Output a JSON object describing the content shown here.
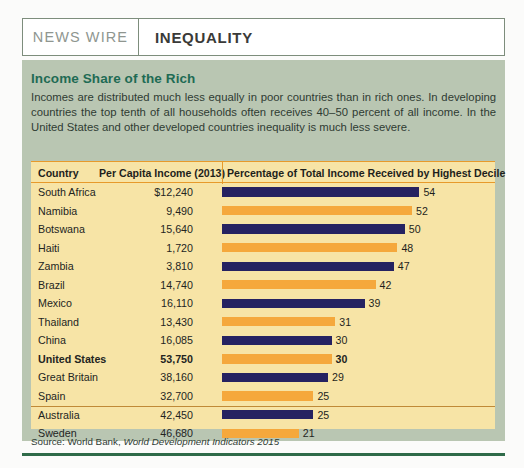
{
  "header": {
    "kicker": "NEWS WIRE",
    "topic": "INEQUALITY"
  },
  "figure": {
    "title": "Income Share of the Rich",
    "intro": "Incomes are distributed much less equally in poor countries than in rich ones. In developing countries the top tenth of all households often receives 40–50 percent of all income. In the United States and other developed countries inequality is much less severe.",
    "source_prefix": "Source: World Bank, ",
    "source_italic": "World Development Indicators 2015"
  },
  "table": {
    "columns": {
      "country": "Country",
      "income": "Per Capita Income (2013)",
      "percentage": "Percentage of Total Income Received by Highest Decile"
    }
  },
  "colors": {
    "navy": "#262261",
    "orange": "#f5a83c",
    "panel_green": "#b9c6b2",
    "panel_yellow": "#f7e4a6",
    "title_green": "#1f6b54",
    "rule_green": "#2f6b49"
  },
  "chart_data": {
    "type": "bar",
    "title": "Income Share of the Rich",
    "subtitle": "Percentage of Total Income Received by Highest Decile",
    "xlabel": "Percentage of Total Income Received by Highest Decile",
    "ylabel": "Country",
    "xlim": [
      0,
      54
    ],
    "grid": false,
    "legend_position": "none",
    "orientation": "horizontal",
    "categories": [
      "South Africa",
      "Namibia",
      "Botswana",
      "Haiti",
      "Zambia",
      "Brazil",
      "Mexico",
      "Thailand",
      "China",
      "United States",
      "Great Britain",
      "Spain",
      "Australia",
      "Sweden"
    ],
    "values": [
      54,
      52,
      50,
      48,
      47,
      42,
      39,
      31,
      30,
      30,
      29,
      25,
      25,
      21
    ],
    "rows": [
      {
        "country": "South Africa",
        "income": "$12,240",
        "value": 54,
        "label": "54",
        "color": "navy",
        "highlight": false
      },
      {
        "country": "Namibia",
        "income": "9,490",
        "value": 52,
        "label": "52",
        "color": "orange",
        "highlight": false
      },
      {
        "country": "Botswana",
        "income": "15,640",
        "value": 50,
        "label": "50",
        "color": "navy",
        "highlight": false
      },
      {
        "country": "Haiti",
        "income": "1,720",
        "value": 48,
        "label": "48",
        "color": "orange",
        "highlight": false
      },
      {
        "country": "Zambia",
        "income": "3,810",
        "value": 47,
        "label": "47",
        "color": "navy",
        "highlight": false
      },
      {
        "country": "Brazil",
        "income": "14,740",
        "value": 42,
        "label": "42",
        "color": "orange",
        "highlight": false
      },
      {
        "country": "Mexico",
        "income": "16,110",
        "value": 39,
        "label": "39",
        "color": "navy",
        "highlight": false
      },
      {
        "country": "Thailand",
        "income": "13,430",
        "value": 31,
        "label": "31",
        "color": "orange",
        "highlight": false
      },
      {
        "country": "China",
        "income": "16,085",
        "value": 30,
        "label": "30",
        "color": "navy",
        "highlight": false
      },
      {
        "country": "United States",
        "income": "53,750",
        "value": 30,
        "label": "30",
        "color": "orange",
        "highlight": true
      },
      {
        "country": "Great Britain",
        "income": "38,160",
        "value": 29,
        "label": "29",
        "color": "navy",
        "highlight": false
      },
      {
        "country": "Spain",
        "income": "32,700",
        "value": 25,
        "label": "25",
        "color": "orange",
        "highlight": false
      },
      {
        "country": "Australia",
        "income": "42,450",
        "value": 25,
        "label": "25",
        "color": "navy",
        "highlight": false
      },
      {
        "country": "Sweden",
        "income": "46,680",
        "value": 21,
        "label": "21",
        "color": "orange",
        "highlight": false
      }
    ]
  }
}
